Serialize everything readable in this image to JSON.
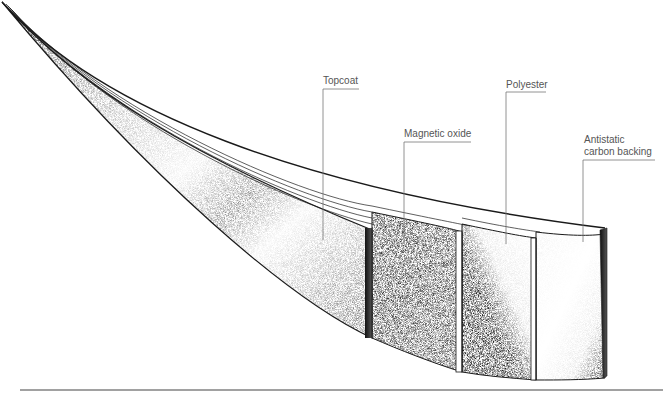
{
  "diagram": {
    "labels": [
      {
        "id": "topcoat",
        "text": "Topcoat"
      },
      {
        "id": "magnetic-oxide",
        "text": "Magnetic oxide"
      },
      {
        "id": "polyester",
        "text": "Polyester"
      },
      {
        "id": "antistatic",
        "text_line1": "Antistatic",
        "text_line2": "carbon backing"
      }
    ],
    "colors": {
      "ink": "#1a1a1a",
      "leader": "#777777",
      "label_text": "#555555",
      "baseline": "#444444"
    }
  }
}
